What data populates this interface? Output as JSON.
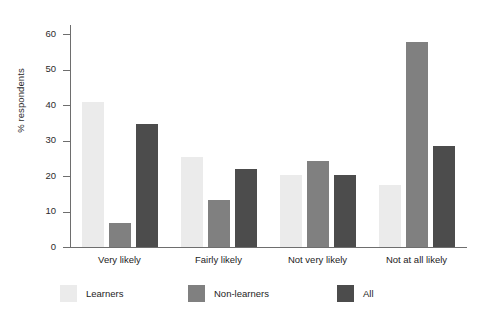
{
  "chart_data": {
    "type": "bar",
    "title": "",
    "xlabel": "",
    "ylabel": "% respondents",
    "ylim": [
      0,
      62
    ],
    "yticks": [
      0,
      10,
      20,
      30,
      40,
      50,
      60
    ],
    "grid": false,
    "legend_position": "bottom",
    "categories": [
      "Very likely",
      "Fairly likely",
      "Not very likely",
      "Not at all likely"
    ],
    "series": [
      {
        "name": "Learners",
        "color": "#ebebeb",
        "values": [
          41.0,
          25.5,
          20.3,
          17.6
        ]
      },
      {
        "name": "Non-learners",
        "color": "#808080",
        "values": [
          6.9,
          13.3,
          24.3,
          57.8
        ]
      },
      {
        "name": "All",
        "color": "#4c4c4c",
        "values": [
          34.7,
          22.1,
          20.3,
          28.5
        ]
      }
    ]
  },
  "axis": {
    "y_title": "% respondents",
    "tick_labels": [
      "0",
      "10",
      "20",
      "30",
      "40",
      "50",
      "60"
    ]
  },
  "legend": {
    "items": [
      {
        "label": "Learners",
        "color": "#ebebeb"
      },
      {
        "label": "Non-learners",
        "color": "#808080"
      },
      {
        "label": "All",
        "color": "#4c4c4c"
      }
    ]
  },
  "colors": {
    "axis": "#6e6e6e",
    "text": "#1d1d1d",
    "background": "#ffffff"
  }
}
